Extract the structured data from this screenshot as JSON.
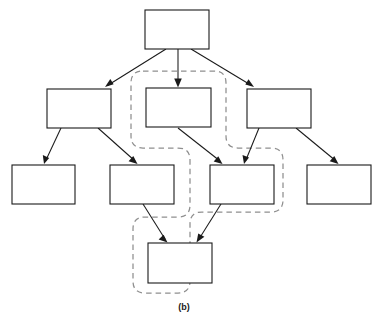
{
  "figure": {
    "caption": "(b)",
    "type": "hierarchy-diagram",
    "colors": {
      "box_stroke": "#1a1a1a",
      "box_fill": "#ffffff",
      "edge": "#1a1a1a",
      "dashed_region": "#8f8f8f",
      "background": "#ffffff"
    }
  },
  "nodes": [
    {
      "id": "n-root",
      "label": "",
      "x": 145,
      "y": 10,
      "w": 64,
      "h": 39,
      "row": "top",
      "col": "center"
    },
    {
      "id": "n-mid-left",
      "label": "",
      "x": 47,
      "y": 89,
      "w": 64,
      "h": 39,
      "row": "middle",
      "col": "left"
    },
    {
      "id": "n-mid-center",
      "label": "",
      "x": 146,
      "y": 88,
      "w": 65,
      "h": 39,
      "row": "middle",
      "col": "center"
    },
    {
      "id": "n-mid-right",
      "label": "",
      "x": 247,
      "y": 89,
      "w": 64,
      "h": 39,
      "row": "middle",
      "col": "right"
    },
    {
      "id": "n-low-1",
      "label": "",
      "x": 12,
      "y": 165,
      "w": 63,
      "h": 39,
      "row": "lower",
      "col": "far-left"
    },
    {
      "id": "n-low-2",
      "label": "",
      "x": 110,
      "y": 165,
      "w": 64,
      "h": 39,
      "row": "lower",
      "col": "left"
    },
    {
      "id": "n-low-3",
      "label": "",
      "x": 210,
      "y": 165,
      "w": 64,
      "h": 39,
      "row": "lower",
      "col": "right"
    },
    {
      "id": "n-low-4",
      "label": "",
      "x": 307,
      "y": 165,
      "w": 64,
      "h": 39,
      "row": "lower",
      "col": "far-right"
    },
    {
      "id": "n-bottom",
      "label": "",
      "x": 148,
      "y": 243,
      "w": 64,
      "h": 40,
      "row": "bottom",
      "col": "center"
    }
  ],
  "edges": [
    {
      "id": "e-root-midleft",
      "from": "n-root",
      "to": "n-mid-left",
      "x1": 166,
      "y1": 49,
      "x2": 105,
      "y2": 87,
      "arrow": true
    },
    {
      "id": "e-root-midcenter",
      "from": "n-root",
      "to": "n-mid-center",
      "x1": 178,
      "y1": 49,
      "x2": 178,
      "y2": 86,
      "arrow": true
    },
    {
      "id": "e-root-midright",
      "from": "n-root",
      "to": "n-mid-right",
      "x1": 191,
      "y1": 49,
      "x2": 254,
      "y2": 87,
      "arrow": true
    },
    {
      "id": "e-midleft-low1",
      "from": "n-mid-left",
      "to": "n-low-1",
      "x1": 61,
      "y1": 128,
      "x2": 44,
      "y2": 163,
      "arrow": true
    },
    {
      "id": "e-midleft-low2",
      "from": "n-mid-left",
      "to": "n-low-2",
      "x1": 98,
      "y1": 128,
      "x2": 137,
      "y2": 163,
      "arrow": true
    },
    {
      "id": "e-midcenter-low3",
      "from": "n-mid-center",
      "to": "n-low-3",
      "x1": 178,
      "y1": 128,
      "x2": 222,
      "y2": 163,
      "arrow": true
    },
    {
      "id": "e-midright-low3",
      "from": "n-mid-right",
      "to": "n-low-3",
      "x1": 259,
      "y1": 128,
      "x2": 244,
      "y2": 163,
      "arrow": true
    },
    {
      "id": "e-midright-low4",
      "from": "n-mid-right",
      "to": "n-low-4",
      "x1": 296,
      "y1": 128,
      "x2": 338,
      "y2": 163,
      "arrow": true
    },
    {
      "id": "e-low2-bottom",
      "from": "n-low-2",
      "to": "n-bottom",
      "x1": 143,
      "y1": 204,
      "x2": 167,
      "y2": 241,
      "arrow": true
    },
    {
      "id": "e-low3-bottom",
      "from": "n-low-3",
      "to": "n-bottom",
      "x1": 221,
      "y1": 204,
      "x2": 197,
      "y2": 241,
      "arrow": true
    }
  ],
  "dashed_region": {
    "id": "dashed-grouping-region",
    "encloses": [
      "n-mid-center",
      "n-low-3",
      "n-bottom"
    ],
    "path": "M 143 71 L 214 71 Q 226 71 226 83 L 226 136 Q 226 148 238 148 L 271 148 Q 283 148 283 160 L 283 200 Q 283 212 271 212 L 202 212 Q 190 212 190 224 L 190 281 Q 190 293 178 293 L 145 293 Q 133 293 133 281 L 133 229 Q 133 217 145 217 L 178 217 Q 190 217 190 205 L 190 160 Q 190 148 178 148 L 143 148 Q 131 148 131 136 L 131 83 Q 131 71 143 71 Z"
  },
  "caption": {
    "text": "(b)",
    "x": 184,
    "y": 310
  }
}
